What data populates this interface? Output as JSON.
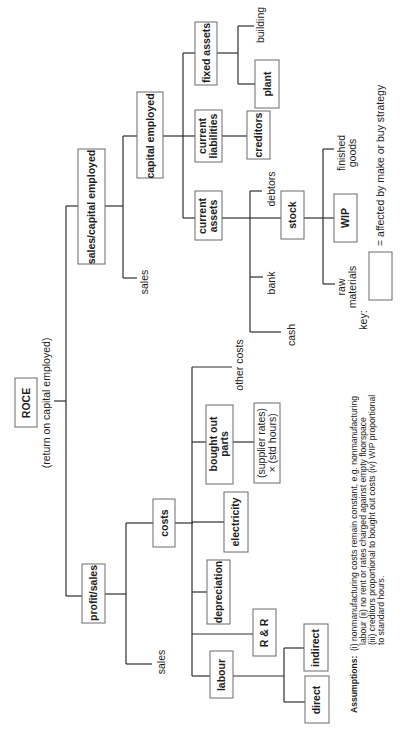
{
  "diagram": {
    "orientation": "rotated 90 degrees counter-clockwise",
    "root": {
      "label": "ROCE",
      "sublabel": "(return on capital employed)"
    },
    "nodes": {
      "sales_capital_employed": "sales/capital employed",
      "sales_top": "sales",
      "capital_employed": "capital employed",
      "current_assets": [
        "current",
        "assets"
      ],
      "current_liabilities": [
        "current",
        "liabilities"
      ],
      "fixed_assets": "fixed assets",
      "creditors": "creditors",
      "plant": "plant",
      "building": "building",
      "debtors": "debtors",
      "stock": "stock",
      "bank": "bank",
      "cash": "cash",
      "wip": "WIP",
      "finished_goods": [
        "finished",
        "goods"
      ],
      "raw_materials": [
        "raw",
        "materials"
      ],
      "profit_sales": "profit/sales",
      "sales_bottom": "sales",
      "costs": "costs",
      "other_costs": "other costs",
      "bought_out_parts": [
        "bought out",
        "parts"
      ],
      "supplier_rates": [
        "(supplier rates)",
        "× (std hours)"
      ],
      "electricity": "electricity",
      "depreciation": "depreciation",
      "r_and_r": "R & R",
      "labour": "labour",
      "indirect": "indirect",
      "direct": "direct"
    },
    "key": {
      "label": "key:",
      "description": "= affected by make or buy strategy"
    },
    "assumptions": {
      "title": "Assumptions:",
      "lines": [
        "(i) nonmanufacturing costs remain constant, e.g. nonmanufacturing",
        "labour (ii) no rent or rates charged against empty floorspace",
        "(iii) creditors proportional to bought out costs (iv) WIP proportional",
        "to standard hours."
      ]
    }
  }
}
